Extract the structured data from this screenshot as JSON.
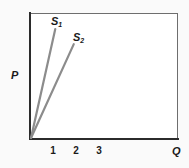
{
  "chart_data": {
    "type": "line",
    "title": "",
    "xlabel": "Q",
    "ylabel": "P",
    "xlim": [
      0,
      6.4
    ],
    "ylim": [
      0,
      1
    ],
    "grid": false,
    "legend": "none",
    "xticks": [
      "1",
      "2",
      "3"
    ],
    "xtick_values": [
      1,
      2,
      3
    ],
    "yticks": [],
    "series": [
      {
        "name": "S1",
        "label": "S",
        "subscript": "1",
        "color": "#8c8c8c",
        "points": [
          [
            0,
            0
          ],
          [
            1.05,
            0.865
          ]
        ],
        "annotation": "S1"
      },
      {
        "name": "S2",
        "label": "S",
        "subscript": "2",
        "color": "#8c8c8c",
        "points": [
          [
            0,
            0
          ],
          [
            1.85,
            0.745
          ]
        ],
        "annotation": "S2"
      }
    ]
  },
  "figure": {
    "axis_y_label": "P",
    "axis_x_label": "Q",
    "tick_1": "1",
    "tick_2": "2",
    "tick_3": "3",
    "curve1_label": "S",
    "curve1_sub": "1",
    "curve2_label": "S",
    "curve2_sub": "2",
    "line_color": "#8c8c8c",
    "axis_color": "#2b2b2b",
    "frame_color": "#6e6e6e",
    "background": "#fafafa",
    "plot_background": "#ffffff"
  }
}
